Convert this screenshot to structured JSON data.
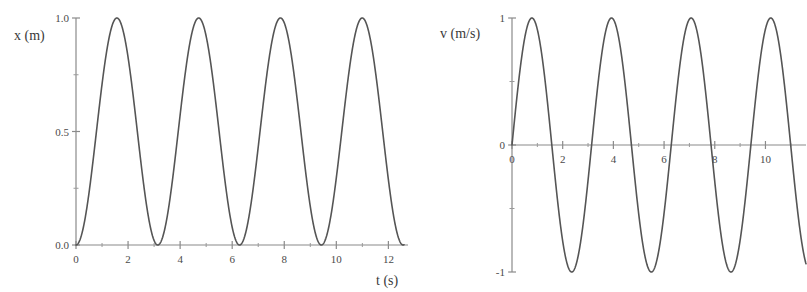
{
  "figure": {
    "background_color": "#ffffff",
    "curve_color": "#555555",
    "axis_color": "#8a8a8a",
    "text_color": "#3a3a3a"
  },
  "chart_data": [
    {
      "type": "line",
      "panel": "left",
      "title": "",
      "ylabel": "x (m)",
      "xlabel": "t (s)",
      "xlim": [
        0,
        12.6
      ],
      "ylim": [
        0,
        1.0
      ],
      "grid": false,
      "legend": null,
      "x_major_ticks": [
        0,
        2,
        4,
        6,
        8,
        10,
        12
      ],
      "x_major_tick_labels": [
        "0",
        "2",
        "4",
        "6",
        "8",
        "10",
        "12"
      ],
      "x_minor_ticks": [
        1,
        3,
        5,
        7,
        9,
        11
      ],
      "y_major_ticks": [
        0.0,
        0.5,
        1.0
      ],
      "y_major_tick_labels": [
        "0.0",
        "0.5",
        "1.0"
      ],
      "y_minor_ticks": [
        0.25,
        0.75
      ],
      "annotations": [],
      "series": [
        {
          "name": "x(t)",
          "equation": "x(t) = 0.5*(1 - cos(2*pi*t/3.1416))",
          "amplitude": 1.0,
          "period": 3.1416,
          "offset": 0.5,
          "minima_t": [
            0.0,
            3.14,
            6.28,
            9.42,
            12.57
          ],
          "maxima_t": [
            1.57,
            4.71,
            7.85,
            11.0
          ],
          "minima_value": 0.0,
          "maxima_value": 1.0,
          "points_t": [
            0.0,
            0.2,
            0.4,
            0.6,
            0.8,
            1.0,
            1.2,
            1.4,
            1.57,
            1.8,
            2.0,
            2.2,
            2.4,
            2.6,
            2.8,
            3.0,
            3.14,
            3.4,
            3.6,
            3.8,
            4.0,
            4.2,
            4.4,
            4.6,
            4.71,
            5.0,
            5.2,
            5.4,
            5.6,
            5.8,
            6.0,
            6.28,
            6.6,
            6.8,
            7.0,
            7.2,
            7.4,
            7.6,
            7.85,
            8.1,
            8.3,
            8.5,
            8.7,
            8.9,
            9.1,
            9.42,
            9.7,
            9.9,
            10.1,
            10.3,
            10.5,
            10.7,
            11.0,
            11.3,
            11.5,
            11.7,
            11.9,
            12.1,
            12.3,
            12.57
          ],
          "points_x": [
            0.0,
            0.04,
            0.15,
            0.32,
            0.52,
            0.71,
            0.87,
            0.97,
            1.0,
            0.95,
            0.82,
            0.65,
            0.45,
            0.26,
            0.1,
            0.01,
            0.0,
            0.07,
            0.2,
            0.38,
            0.58,
            0.76,
            0.9,
            0.99,
            1.0,
            0.92,
            0.81,
            0.63,
            0.43,
            0.24,
            0.09,
            0.0,
            0.1,
            0.24,
            0.43,
            0.63,
            0.81,
            0.93,
            1.0,
            0.95,
            0.84,
            0.68,
            0.49,
            0.29,
            0.12,
            0.0,
            0.08,
            0.19,
            0.35,
            0.53,
            0.71,
            0.86,
            1.0,
            0.93,
            0.81,
            0.64,
            0.45,
            0.26,
            0.1,
            0.0
          ]
        }
      ]
    },
    {
      "type": "line",
      "panel": "right",
      "title": "",
      "ylabel": "v (m/s)",
      "xlabel": "",
      "xlim": [
        0,
        11.6
      ],
      "ylim": [
        -1,
        1
      ],
      "grid": false,
      "legend": null,
      "x_major_ticks": [
        0,
        2,
        4,
        6,
        8,
        10
      ],
      "x_major_tick_labels": [
        "0",
        "2",
        "4",
        "6",
        "8",
        "10"
      ],
      "x_minor_ticks": [
        1,
        3,
        5,
        7,
        9,
        11
      ],
      "y_major_ticks": [
        -1,
        0,
        1
      ],
      "y_major_tick_labels": [
        "-1",
        "0",
        "1"
      ],
      "y_minor_ticks": [
        -0.5,
        0.5
      ],
      "annotations": [],
      "series": [
        {
          "name": "v(t)",
          "equation": "v(t) = sin(2*pi*t/3.1416)",
          "amplitude": 1.0,
          "period": 3.1416,
          "offset": 0.0,
          "maxima_t": [
            0.785,
            3.93,
            7.07,
            10.21
          ],
          "minima_t": [
            2.36,
            5.5,
            8.64,
            11.78
          ],
          "maxima_value": 1.0,
          "minima_value": -1.0,
          "zero_crossings_t": [
            0.0,
            1.57,
            3.14,
            4.71,
            6.28,
            7.85,
            9.42,
            11.0
          ],
          "points_t": [
            0.0,
            0.15,
            0.3,
            0.45,
            0.6,
            0.785,
            0.95,
            1.1,
            1.25,
            1.4,
            1.57,
            1.75,
            1.95,
            2.15,
            2.36,
            2.55,
            2.75,
            2.95,
            3.14,
            3.35,
            3.55,
            3.75,
            3.93,
            4.15,
            4.35,
            4.55,
            4.71,
            4.95,
            5.15,
            5.35,
            5.5,
            5.7,
            5.9,
            6.1,
            6.28,
            6.5,
            6.7,
            6.9,
            7.07,
            7.3,
            7.5,
            7.7,
            7.85,
            8.1,
            8.3,
            8.5,
            8.64,
            8.85,
            9.05,
            9.25,
            9.42,
            9.65,
            9.9,
            10.05,
            10.21,
            10.45,
            10.65,
            10.85,
            11.0,
            11.2,
            11.4,
            11.6
          ],
          "points_v": [
            0.0,
            0.29,
            0.55,
            0.77,
            0.93,
            1.0,
            0.99,
            0.9,
            0.73,
            0.5,
            0.0,
            -0.35,
            -0.69,
            -0.92,
            -1.0,
            -0.96,
            -0.8,
            -0.54,
            0.0,
            0.4,
            0.7,
            0.91,
            1.0,
            0.96,
            0.83,
            0.6,
            0.0,
            -0.45,
            -0.73,
            -0.92,
            -1.0,
            -0.96,
            -0.82,
            -0.57,
            0.0,
            0.42,
            0.72,
            0.92,
            1.0,
            0.94,
            0.8,
            0.55,
            0.0,
            -0.45,
            -0.75,
            -0.94,
            -1.0,
            -0.96,
            -0.81,
            -0.55,
            0.0,
            0.44,
            0.78,
            0.93,
            1.0,
            0.95,
            0.82,
            0.59,
            0.0,
            -0.39,
            -0.7,
            -0.89
          ]
        }
      ]
    }
  ]
}
